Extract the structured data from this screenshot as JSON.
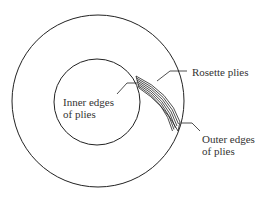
{
  "diagram": {
    "type": "cross-section",
    "stroke_color": "#222222",
    "text_color": "#333333",
    "outer_circle": {
      "cx": 98,
      "cy": 101,
      "r": 86
    },
    "inner_circle": {
      "cx": 97,
      "cy": 102,
      "r": 43
    },
    "ply_count": 7,
    "labels": {
      "rosette_plies": "Rosette plies",
      "inner_edges_line1": "Inner edges",
      "inner_edges_line2": "of plies",
      "outer_edges_line1": "Outer edges",
      "outer_edges_line2": "of plies"
    }
  }
}
